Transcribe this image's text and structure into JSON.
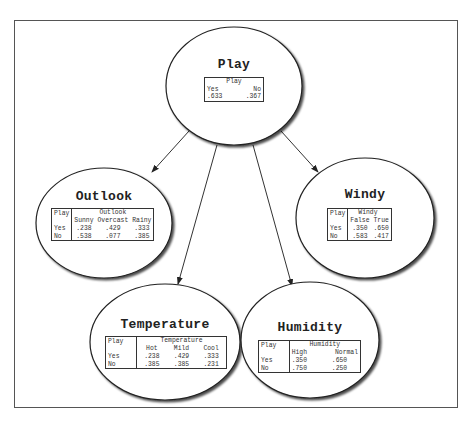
{
  "diagram": {
    "type": "bayesian-network",
    "nodes": {
      "play": {
        "title": "Play",
        "table": {
          "header": "Play",
          "columns": [
            "Yes",
            "No"
          ],
          "values": [
            ".633",
            ".367"
          ]
        }
      },
      "outlook": {
        "title": "Outlook",
        "table": {
          "parent": "Play",
          "header": "Outlook",
          "columns": [
            "Sunny",
            "Overcast",
            "Rainy"
          ],
          "rows": [
            {
              "label": "Yes",
              "values": [
                ".238",
                ".429",
                ".333"
              ]
            },
            {
              "label": "No",
              "values": [
                ".538",
                ".077",
                ".385"
              ]
            }
          ]
        }
      },
      "windy": {
        "title": "Windy",
        "table": {
          "parent": "Play",
          "header": "Windy",
          "columns": [
            "False",
            "True"
          ],
          "rows": [
            {
              "label": "Yes",
              "values": [
                ".350",
                ".650"
              ]
            },
            {
              "label": "No",
              "values": [
                ".583",
                ".417"
              ]
            }
          ]
        }
      },
      "temperature": {
        "title": "Temperature",
        "table": {
          "parent": "Play",
          "header": "Temperature",
          "columns": [
            "Hot",
            "Mild",
            "Cool"
          ],
          "rows": [
            {
              "label": "Yes",
              "values": [
                ".238",
                ".429",
                ".333"
              ]
            },
            {
              "label": "No",
              "values": [
                ".385",
                ".385",
                ".231"
              ]
            }
          ]
        }
      },
      "humidity": {
        "title": "Humidity",
        "table": {
          "parent": "Play",
          "header": "Humidity",
          "columns": [
            "High",
            "Normal"
          ],
          "rows": [
            {
              "label": "Yes",
              "values": [
                ".350",
                ".650"
              ]
            },
            {
              "label": "No",
              "values": [
                ".750",
                ".250"
              ]
            }
          ]
        }
      }
    },
    "edges": [
      {
        "from": "Play",
        "to": "Outlook"
      },
      {
        "from": "Play",
        "to": "Temperature"
      },
      {
        "from": "Play",
        "to": "Humidity"
      },
      {
        "from": "Play",
        "to": "Windy"
      }
    ]
  }
}
